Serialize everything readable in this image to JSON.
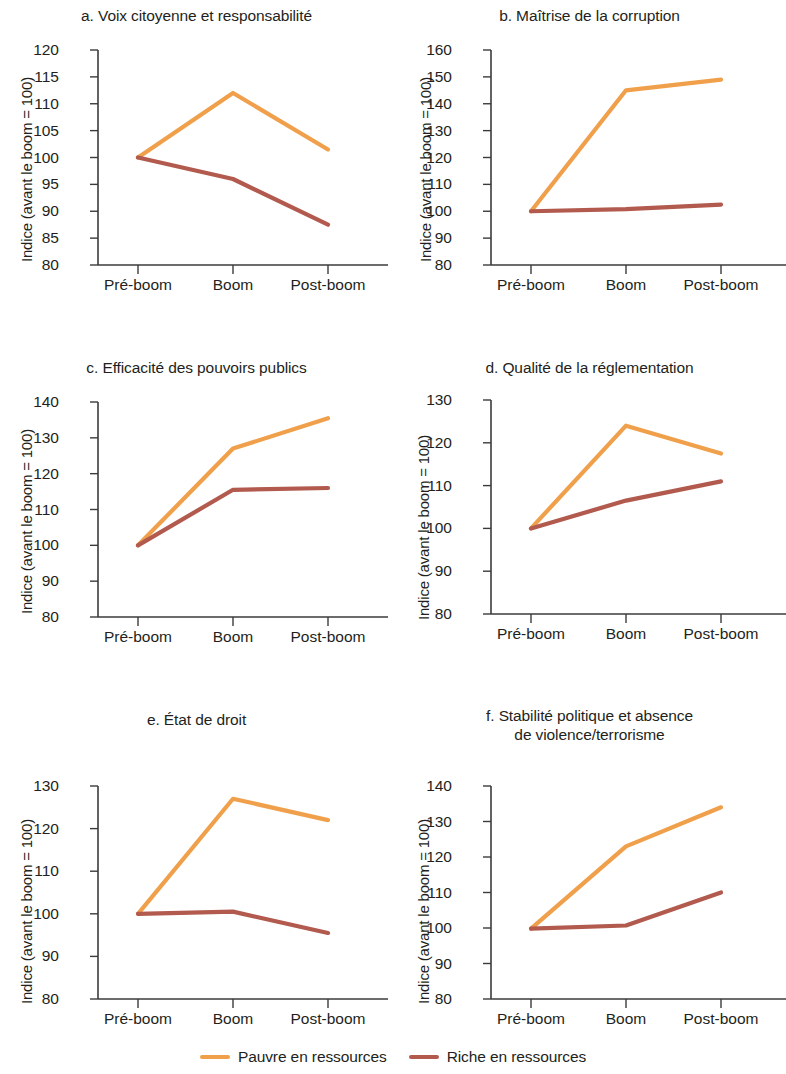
{
  "figure": {
    "ylabel": "Indice (avant le boom = 100)",
    "categories": [
      "Pré-boom",
      "Boom",
      "Post-boom"
    ],
    "colors": {
      "resource_poor": "#f0a04b",
      "resource_rich": "#b25a4e",
      "axis": "#3b3b3b",
      "text": "#231f20"
    }
  },
  "legend": {
    "items": [
      {
        "label": "Pauvre en ressources",
        "color": "#f0a04b"
      },
      {
        "label": "Riche en ressources",
        "color": "#b25a4e"
      }
    ]
  },
  "chart_data": [
    {
      "type": "line",
      "panel": "a",
      "title": "a. Voix citoyenne et responsabilité",
      "xlabel": "",
      "ylabel": "Indice (avant le boom = 100)",
      "categories": [
        "Pré-boom",
        "Boom",
        "Post-boom"
      ],
      "ylim": [
        80,
        120
      ],
      "yticks": [
        80,
        85,
        90,
        95,
        100,
        105,
        110,
        115,
        120
      ],
      "grid": false,
      "legend_position": "bottom",
      "series": [
        {
          "name": "Pauvre en ressources",
          "color": "#f0a04b",
          "values": [
            100,
            112,
            101.5
          ]
        },
        {
          "name": "Riche en ressources",
          "color": "#b25a4e",
          "values": [
            100,
            96,
            87.5
          ]
        }
      ]
    },
    {
      "type": "line",
      "panel": "b",
      "title": "b. Maîtrise de la corruption",
      "xlabel": "",
      "ylabel": "Indice (avant le boom = 100)",
      "categories": [
        "Pré-boom",
        "Boom",
        "Post-boom"
      ],
      "ylim": [
        80,
        160
      ],
      "yticks": [
        80,
        90,
        100,
        110,
        120,
        130,
        140,
        150,
        160
      ],
      "grid": false,
      "legend_position": "bottom",
      "series": [
        {
          "name": "Pauvre en ressources",
          "color": "#f0a04b",
          "values": [
            100,
            145,
            149
          ]
        },
        {
          "name": "Riche en ressources",
          "color": "#b25a4e",
          "values": [
            100,
            100.8,
            102.5
          ]
        }
      ]
    },
    {
      "type": "line",
      "panel": "c",
      "title": "c. Efficacité des pouvoirs publics",
      "xlabel": "",
      "ylabel": "Indice (avant le boom = 100)",
      "categories": [
        "Pré-boom",
        "Boom",
        "Post-boom"
      ],
      "ylim": [
        80,
        140
      ],
      "yticks": [
        80,
        90,
        100,
        110,
        120,
        130,
        140
      ],
      "grid": false,
      "legend_position": "bottom",
      "series": [
        {
          "name": "Pauvre en ressources",
          "color": "#f0a04b",
          "values": [
            100,
            127,
            135.5
          ]
        },
        {
          "name": "Riche en ressources",
          "color": "#b25a4e",
          "values": [
            100,
            115.5,
            116
          ]
        }
      ]
    },
    {
      "type": "line",
      "panel": "d",
      "title": "d. Qualité de la réglementation",
      "xlabel": "",
      "ylabel": "Indice (avant le boom = 100)",
      "categories": [
        "Pré-boom",
        "Boom",
        "Post-boom"
      ],
      "ylim": [
        80,
        130
      ],
      "yticks": [
        80,
        90,
        100,
        110,
        120,
        130
      ],
      "grid": false,
      "legend_position": "bottom",
      "series": [
        {
          "name": "Pauvre en ressources",
          "color": "#f0a04b",
          "values": [
            100,
            124,
            117.5
          ]
        },
        {
          "name": "Riche en ressources",
          "color": "#b25a4e",
          "values": [
            100,
            106.5,
            111
          ]
        }
      ]
    },
    {
      "type": "line",
      "panel": "e",
      "title": "e. État de droit",
      "xlabel": "",
      "ylabel": "Indice (avant le boom = 100)",
      "categories": [
        "Pré-boom",
        "Boom",
        "Post-boom"
      ],
      "ylim": [
        80,
        130
      ],
      "yticks": [
        80,
        90,
        100,
        110,
        120,
        130
      ],
      "grid": false,
      "legend_position": "bottom",
      "series": [
        {
          "name": "Pauvre en ressources",
          "color": "#f0a04b",
          "values": [
            100,
            127,
            122
          ]
        },
        {
          "name": "Riche en ressources",
          "color": "#b25a4e",
          "values": [
            100,
            100.5,
            95.5
          ]
        }
      ]
    },
    {
      "type": "line",
      "panel": "f",
      "title_line1": "f. Stabilité politique et absence",
      "title_line2": "de violence/terrorisme",
      "title": "f. Stabilité politique et absence de violence/terrorisme",
      "xlabel": "",
      "ylabel": "Indice (avant le boom = 100)",
      "categories": [
        "Pré-boom",
        "Boom",
        "Post-boom"
      ],
      "ylim": [
        80,
        140
      ],
      "yticks": [
        80,
        90,
        100,
        110,
        120,
        130,
        140
      ],
      "grid": false,
      "legend_position": "bottom",
      "series": [
        {
          "name": "Pauvre en ressources",
          "color": "#f0a04b",
          "values": [
            99.8,
            123,
            134
          ]
        },
        {
          "name": "Riche en ressources",
          "color": "#b25a4e",
          "values": [
            99.8,
            100.7,
            110
          ]
        }
      ]
    }
  ]
}
